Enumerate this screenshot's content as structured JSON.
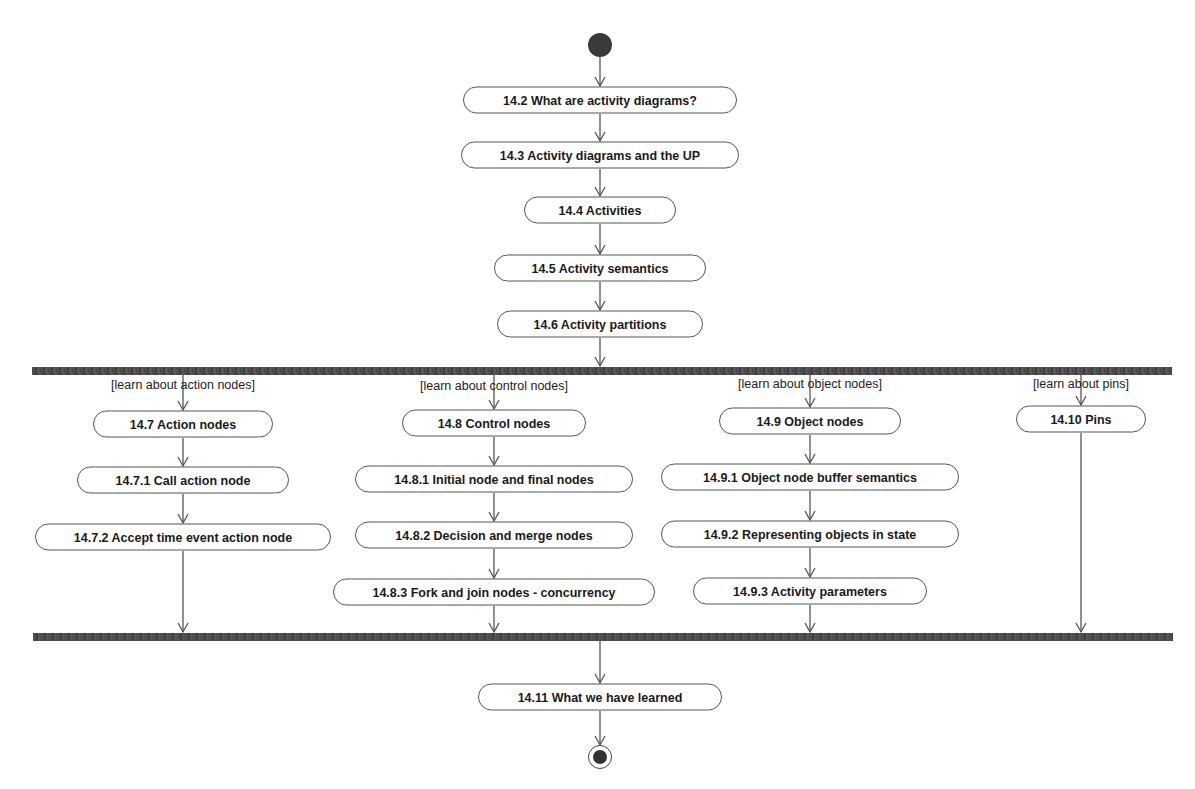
{
  "diagram": {
    "type": "UML activity diagram",
    "initial_node": {
      "x": 600,
      "y": 45
    },
    "final_node": {
      "x": 600,
      "y": 757
    },
    "fork_bar": {
      "x1": 32,
      "x2": 1172,
      "y": 367,
      "h": 8
    },
    "join_bar": {
      "x1": 33,
      "x2": 1173,
      "y": 633,
      "h": 8
    },
    "nodes": {
      "n14_2": {
        "label": "14.2 What are activity diagrams?",
        "x": 600,
        "y": 100,
        "w": 274,
        "h": 27
      },
      "n14_3": {
        "label": "14.3 Activity diagrams and the UP",
        "x": 600,
        "y": 155,
        "w": 278,
        "h": 27
      },
      "n14_4": {
        "label": "14.4 Activities",
        "x": 600,
        "y": 210,
        "w": 152,
        "h": 27
      },
      "n14_5": {
        "label": "14.5 Activity semantics",
        "x": 600,
        "y": 268,
        "w": 212,
        "h": 27
      },
      "n14_6": {
        "label": "14.6 Activity partitions",
        "x": 600,
        "y": 324,
        "w": 206,
        "h": 27
      },
      "n14_7": {
        "label": "14.7 Action nodes",
        "x": 183,
        "y": 424,
        "w": 180,
        "h": 27
      },
      "n14_7_1": {
        "label": "14.7.1  Call action node",
        "x": 183,
        "y": 480,
        "w": 212,
        "h": 27
      },
      "n14_7_2": {
        "label": "14.7.2 Accept time event action node",
        "x": 183,
        "y": 537,
        "w": 296,
        "h": 27
      },
      "n14_8": {
        "label": "14.8 Control nodes",
        "x": 479,
        "y": 423,
        "w": 184,
        "h": 27
      },
      "n14_8_1": {
        "label": "14.8.1 Initial node and final nodes",
        "x": 479,
        "y": 479,
        "w": 278,
        "h": 27
      },
      "n14_8_2": {
        "label": "14.8.2 Decision and merge nodes",
        "x": 479,
        "y": 535,
        "w": 278,
        "h": 27
      },
      "n14_8_3": {
        "label": "14.8.3 Fork and join nodes - concurrency",
        "x": 495,
        "y": 592,
        "w": 322,
        "h": 27
      },
      "n14_9": {
        "label": "14.9 Object nodes",
        "x": 810,
        "y": 421,
        "w": 182,
        "h": 27
      },
      "n14_9_1": {
        "label": "14.9.1 Object node buffer semantics",
        "x": 810,
        "y": 477,
        "w": 298,
        "h": 27
      },
      "n14_9_2": {
        "label": "14.9.2 Representing objects in state",
        "x": 810,
        "y": 534,
        "w": 298,
        "h": 27
      },
      "n14_9_3": {
        "label": "14.9.3 Activity parameters",
        "x": 810,
        "y": 591,
        "w": 234,
        "h": 27
      },
      "n14_10": {
        "label": "14.10 Pins",
        "x": 1081,
        "y": 419,
        "w": 130,
        "h": 27
      },
      "n14_11": {
        "label": "14.11 What we have learned",
        "x": 600,
        "y": 697,
        "w": 244,
        "h": 27
      }
    },
    "guards": {
      "g_action": {
        "label": "[learn about action nodes]",
        "x": 183,
        "y": 385
      },
      "g_control": {
        "label": "[learn about control nodes]",
        "x": 494,
        "y": 386
      },
      "g_object": {
        "label": "[learn about object nodes]",
        "x": 810,
        "y": 384
      },
      "g_pins": {
        "label": "[learn about pins]",
        "x": 1081,
        "y": 384
      }
    },
    "edges": [
      {
        "x1": 600,
        "y1": 57,
        "x2": 600,
        "y2": 86
      },
      {
        "x1": 600,
        "y1": 114,
        "x2": 600,
        "y2": 141
      },
      {
        "x1": 600,
        "y1": 169,
        "x2": 600,
        "y2": 196
      },
      {
        "x1": 600,
        "y1": 224,
        "x2": 600,
        "y2": 254
      },
      {
        "x1": 600,
        "y1": 282,
        "x2": 600,
        "y2": 310
      },
      {
        "x1": 600,
        "y1": 338,
        "x2": 600,
        "y2": 366
      },
      {
        "x1": 183,
        "y1": 375,
        "x2": 183,
        "y2": 410
      },
      {
        "x1": 183,
        "y1": 438,
        "x2": 183,
        "y2": 466
      },
      {
        "x1": 183,
        "y1": 494,
        "x2": 183,
        "y2": 523
      },
      {
        "x1": 183,
        "y1": 551,
        "x2": 183,
        "y2": 632
      },
      {
        "x1": 494,
        "y1": 375,
        "x2": 494,
        "y2": 409
      },
      {
        "x1": 494,
        "y1": 437,
        "x2": 494,
        "y2": 465
      },
      {
        "x1": 494,
        "y1": 493,
        "x2": 494,
        "y2": 521
      },
      {
        "x1": 494,
        "y1": 549,
        "x2": 494,
        "y2": 578
      },
      {
        "x1": 494,
        "y1": 606,
        "x2": 494,
        "y2": 632
      },
      {
        "x1": 810,
        "y1": 375,
        "x2": 810,
        "y2": 407
      },
      {
        "x1": 810,
        "y1": 435,
        "x2": 810,
        "y2": 463
      },
      {
        "x1": 810,
        "y1": 491,
        "x2": 810,
        "y2": 520
      },
      {
        "x1": 810,
        "y1": 548,
        "x2": 810,
        "y2": 577
      },
      {
        "x1": 810,
        "y1": 605,
        "x2": 810,
        "y2": 632
      },
      {
        "x1": 1081,
        "y1": 375,
        "x2": 1081,
        "y2": 405
      },
      {
        "x1": 1081,
        "y1": 433,
        "x2": 1081,
        "y2": 632
      },
      {
        "x1": 600,
        "y1": 641,
        "x2": 600,
        "y2": 683
      },
      {
        "x1": 600,
        "y1": 711,
        "x2": 600,
        "y2": 745
      }
    ],
    "colors": {
      "line": "#555555",
      "bar": "#4a4a4a",
      "node_border": "#555555",
      "text": "#1a1a1a"
    }
  }
}
